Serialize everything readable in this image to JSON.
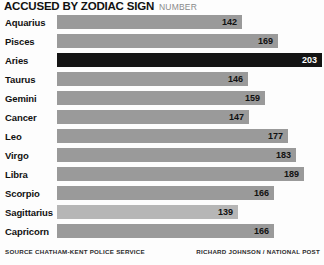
{
  "header": {
    "title": "ACCUSED BY ZODIAC SIGN",
    "subtitle": "NUMBER"
  },
  "footer": {
    "source": "SOURCE CHATHAM-KENT POLICE SERVICE",
    "credit": "RICHARD JOHNSON / NATIONAL POST"
  },
  "colors": {
    "bar": "#9a9a9a",
    "bar_light": "#b6b6b6",
    "bar_highlight": "#141414",
    "value_text": "#111111",
    "value_text_highlight": "#ffffff",
    "background": "#fdfdfd"
  },
  "chart_data": {
    "type": "bar",
    "orientation": "horizontal",
    "title": "ACCUSED BY ZODIAC SIGN",
    "subtitle": "NUMBER",
    "xlabel": "",
    "ylabel": "",
    "grid": false,
    "legend": "none",
    "xlim": [
      0,
      203
    ],
    "categories": [
      "Aquarius",
      "Pisces",
      "Aries",
      "Taurus",
      "Gemini",
      "Cancer",
      "Leo",
      "Virgo",
      "Libra",
      "Scorpio",
      "Sagittarius",
      "Capricorn"
    ],
    "values": [
      142,
      169,
      203,
      146,
      159,
      147,
      177,
      183,
      189,
      166,
      139,
      166
    ],
    "highlight_category": "Aries",
    "minimum_category": "Sagittarius",
    "bars": [
      {
        "label": "Aquarius",
        "value": 142,
        "style": "normal"
      },
      {
        "label": "Pisces",
        "value": 169,
        "style": "normal"
      },
      {
        "label": "Aries",
        "value": 203,
        "style": "highlight"
      },
      {
        "label": "Taurus",
        "value": 146,
        "style": "normal"
      },
      {
        "label": "Gemini",
        "value": 159,
        "style": "normal"
      },
      {
        "label": "Cancer",
        "value": 147,
        "style": "normal"
      },
      {
        "label": "Leo",
        "value": 177,
        "style": "normal"
      },
      {
        "label": "Virgo",
        "value": 183,
        "style": "normal"
      },
      {
        "label": "Libra",
        "value": 189,
        "style": "normal"
      },
      {
        "label": "Scorpio",
        "value": 166,
        "style": "normal"
      },
      {
        "label": "Sagittarius",
        "value": 139,
        "style": "light"
      },
      {
        "label": "Capricorn",
        "value": 166,
        "style": "normal"
      }
    ]
  }
}
